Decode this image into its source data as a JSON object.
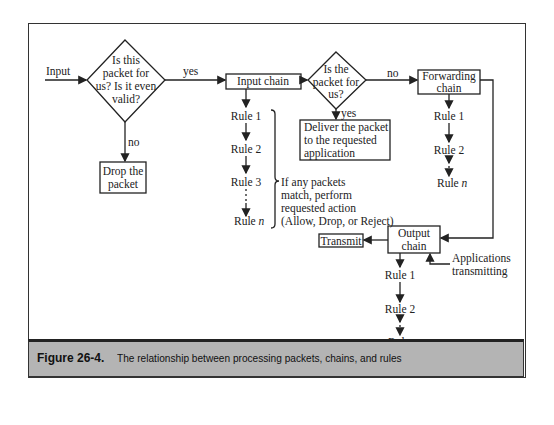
{
  "figure": {
    "number": "Figure 26-4.",
    "caption": "The relationship between processing packets, chains, and rules"
  },
  "nodes": {
    "input_label": "Input",
    "decision1": [
      "Is this",
      "packet for",
      "us? Is it even",
      "valid?"
    ],
    "drop": [
      "Drop the",
      "packet"
    ],
    "input_chain": "Input chain",
    "decision2": [
      "Is the",
      "packet for",
      "us?"
    ],
    "deliver": [
      "Deliver the packet",
      "to the requested",
      "application"
    ],
    "forwarding_chain": [
      "Forwarding",
      "chain"
    ],
    "output_chain": [
      "Output",
      "chain"
    ],
    "transmit": "Transmit",
    "apps_transmitting": [
      "Applications",
      "transmitting"
    ]
  },
  "edges": {
    "yes1": "yes",
    "no1": "no",
    "yes2": "yes",
    "no2": "no"
  },
  "input_rules": [
    "Rule 1",
    "Rule 2",
    "Rule 3",
    "Rule "
  ],
  "forward_rules": [
    "Rule 1",
    "Rule 2",
    "Rule "
  ],
  "output_rules": [
    "Rule 1",
    "Rule 2",
    "Rule "
  ],
  "rule_n_var": "n",
  "brace_note": [
    "If any packets",
    "match, perform",
    "requested action",
    "(Allow, Drop, or Reject)"
  ]
}
